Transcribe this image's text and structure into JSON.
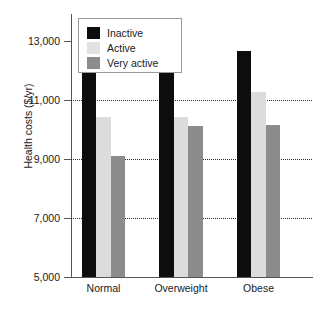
{
  "chart_data": {
    "type": "bar",
    "title": "",
    "subtitle": "",
    "xlabel": "",
    "ylabel": "Health costs ($/yr)",
    "categories": [
      "Normal",
      "Overweight",
      "Obese"
    ],
    "series": [
      {
        "name": "Inactive",
        "color": "#0d0d0d",
        "values": [
          12450,
          12000,
          12650
        ]
      },
      {
        "name": "Active",
        "color": "#dcdcdc",
        "values": [
          10400,
          10400,
          11250
        ]
      },
      {
        "name": "Very active",
        "color": "#8c8c8c",
        "values": [
          9100,
          10100,
          10150
        ]
      }
    ],
    "ylim": [
      5000,
      13900
    ],
    "yticks": [
      5000,
      7000,
      9000,
      11000,
      13000
    ],
    "ytick_labels": [
      "5,000",
      "7,000",
      "9,000",
      "11,000",
      "13,000"
    ],
    "gridlines": [
      7000,
      9000,
      11000
    ],
    "grid": true,
    "legend_position": "top-left",
    "legend_entries": [
      "Inactive",
      "Active",
      "Very active"
    ]
  }
}
